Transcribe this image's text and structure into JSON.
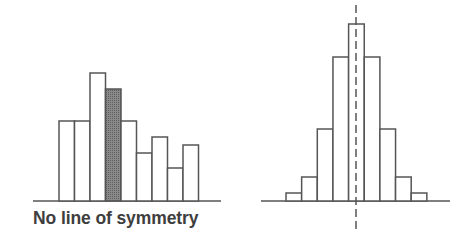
{
  "colors": {
    "stroke": "#555555",
    "bar_fill": "#ffffff",
    "highlight_fill": "#7a7a7a",
    "axis_line": "#555555",
    "symmetry_line": "#555555",
    "caption_text": "#3e3e3e"
  },
  "chart_data": [
    {
      "type": "bar",
      "title": "",
      "caption": "No line of symmetry",
      "xlabel": "",
      "ylabel": "",
      "grid": false,
      "legend": "none",
      "description": "Asymmetric histogram with 9 adjacent bars; 4th bar shaded",
      "categories": [
        "1",
        "2",
        "3",
        "4",
        "5",
        "6",
        "7",
        "8",
        "9"
      ],
      "values": [
        80,
        80,
        128,
        112,
        80,
        48,
        64,
        33,
        56
      ],
      "highlighted_index": 3,
      "ylim": [
        0,
        130
      ]
    },
    {
      "type": "bar",
      "title": "",
      "caption": "",
      "xlabel": "",
      "ylabel": "",
      "grid": false,
      "legend": "none",
      "description": "Symmetric histogram with 9 adjacent bars and a dashed vertical line of symmetry through the center bar",
      "categories": [
        "1",
        "2",
        "3",
        "4",
        "5",
        "6",
        "7",
        "8",
        "9"
      ],
      "values": [
        8,
        24,
        72,
        144,
        177,
        144,
        72,
        24,
        8
      ],
      "symmetry_line": "dashed vertical through center of bar 5",
      "ylim": [
        0,
        180
      ]
    }
  ],
  "labels": {
    "left_caption": "No line of symmetry"
  }
}
